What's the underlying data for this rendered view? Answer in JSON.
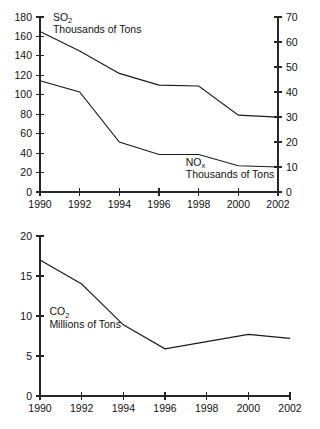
{
  "chart_data": [
    {
      "id": "emissions-so2-nox",
      "type": "line",
      "title": "",
      "subtitle": "",
      "xlabel": "",
      "ylabel": "Thousands of Tons",
      "x": [
        1990,
        1992,
        1994,
        1996,
        1998,
        2000,
        2002
      ],
      "xticklabels": [
        "1990",
        "1992",
        "1994",
        "1996",
        "1998",
        "2000",
        "2002"
      ],
      "xlim": [
        1990,
        2002
      ],
      "grid": false,
      "legend_position": "inline-annotation",
      "axes": {
        "left": {
          "ylim": [
            0,
            180
          ],
          "ytick_step": 20,
          "yticklabels": [
            "0",
            "20",
            "40",
            "60",
            "80",
            "100",
            "120",
            "140",
            "160",
            "180"
          ],
          "unit": "Thousands of Tons",
          "series_ref": "SO2"
        },
        "right": {
          "ylim": [
            0,
            70
          ],
          "ytick_step": 10,
          "yticklabels": [
            "0",
            "10",
            "20",
            "30",
            "40",
            "50",
            "60",
            "70"
          ],
          "unit": "Thousands of Tons",
          "series_ref": "NOx"
        }
      },
      "series": [
        {
          "name": "SO2",
          "name_base": "SO",
          "name_sub": "2",
          "unit_label": "Thousands of Tons",
          "axis": "left",
          "values": [
            165,
            145,
            122,
            110,
            109,
            79,
            77
          ],
          "label_x": 1990.65,
          "label_y": 176
        },
        {
          "name": "NOx",
          "name_base": "NO",
          "name_sub": "x",
          "unit_label": "Thousands of Tons",
          "axis": "right",
          "values": [
            44.5,
            40.0,
            20.0,
            15.0,
            15.0,
            10.5,
            10.0
          ],
          "label_x": 1997.35,
          "label_y": 10.6
        }
      ]
    },
    {
      "id": "emissions-co2",
      "type": "line",
      "title": "",
      "subtitle": "",
      "xlabel": "",
      "ylabel": "Millions of Tons",
      "x": [
        1990,
        1992,
        1994,
        1996,
        1998,
        2000,
        2002
      ],
      "xticklabels": [
        "1990",
        "1992",
        "1994",
        "1996",
        "1998",
        "2000",
        "2002"
      ],
      "xlim": [
        1990,
        2002
      ],
      "ylim": [
        0,
        20
      ],
      "ytick_step": 5,
      "yticklabels": [
        "0",
        "5",
        "10",
        "15",
        "20"
      ],
      "grid": false,
      "legend_position": "inline-annotation",
      "series": [
        {
          "name": "CO2",
          "name_base": "CO",
          "name_sub": "2",
          "unit_label": "Millions of Tons",
          "values": [
            17.0,
            14.0,
            8.9,
            5.9,
            6.8,
            7.7,
            7.2
          ],
          "label_x": 1990.45,
          "label_y": 10.1
        }
      ]
    }
  ],
  "colors": {
    "line": "#1a1a1a",
    "axis": "#262626",
    "text": "#111111",
    "background": "#ffffff"
  }
}
